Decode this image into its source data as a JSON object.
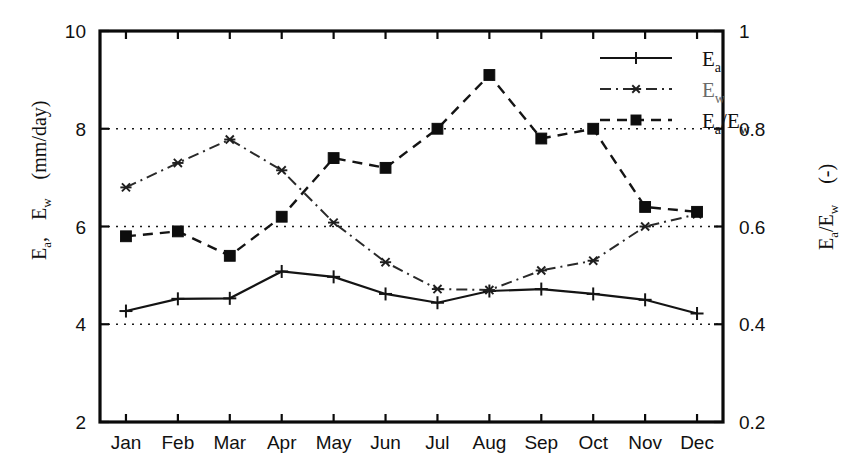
{
  "chart_data": {
    "type": "line",
    "title": "",
    "subtitle": "",
    "xlabel": "",
    "ylabel": "E_a ,  E_w   (mm/day)",
    "y2label": "E_a / E_w   (-)",
    "categories": [
      "Jan",
      "Feb",
      "Mar",
      "Apr",
      "May",
      "Jun",
      "Jul",
      "Aug",
      "Sep",
      "Oct",
      "Nov",
      "Dec"
    ],
    "ylim": [
      2,
      10
    ],
    "yticks": [
      2,
      4,
      6,
      8,
      10
    ],
    "ytick_labels": [
      "2",
      "4",
      "6",
      "8",
      "10"
    ],
    "y2lim": [
      0.2,
      1.0
    ],
    "y2ticks": [
      0.2,
      0.4,
      0.6,
      0.8,
      1.0
    ],
    "y2tick_labels": [
      "0.2",
      "0.4",
      "0.6",
      "0.8",
      "1"
    ],
    "grid": true,
    "gridlines_at": [
      4,
      6,
      8
    ],
    "legend_position": "top-right",
    "series": [
      {
        "name": "E_a",
        "legend_label_base": "E",
        "legend_label_sub": "a",
        "axis": "left",
        "line_style": "solid",
        "marker": "plus",
        "values": [
          4.27,
          4.52,
          4.53,
          5.08,
          4.97,
          4.62,
          4.44,
          4.68,
          4.72,
          4.62,
          4.5,
          4.22
        ]
      },
      {
        "name": "E_w",
        "legend_label_base": "E",
        "legend_label_sub": "w",
        "axis": "left",
        "line_style": "dashdot",
        "marker": "star",
        "values": [
          6.8,
          7.3,
          7.78,
          7.15,
          6.08,
          5.27,
          4.72,
          4.7,
          5.1,
          5.3,
          6.0,
          6.25
        ]
      },
      {
        "name": "E_a/E_w",
        "legend_label_base": "E",
        "legend_label_sub": "a",
        "legend_label_base2": "/E",
        "legend_label_sub2": "w",
        "axis": "right",
        "line_style": "dashed",
        "marker": "square",
        "values": [
          0.58,
          0.59,
          0.54,
          0.62,
          0.74,
          0.72,
          0.8,
          0.91,
          0.78,
          0.8,
          0.64,
          0.63
        ]
      }
    ]
  },
  "axes": {
    "left_title_part1": "E",
    "left_title_sub1": "a",
    "left_title_comma": ",",
    "left_title_part2": "E",
    "left_title_sub2": "w",
    "left_title_units": "(mm/day)",
    "right_title_part1": "E",
    "right_title_sub1": "a",
    "right_title_slash": "/E",
    "right_title_sub2": "w",
    "right_title_units": "(-)"
  },
  "colors": {
    "background": "#ffffff",
    "frame": "#0a0a0a",
    "series_ea": "#141414",
    "series_ew": "#2a2a2a",
    "series_ratio": "#0d0d0d",
    "grid": "#1a1a1a"
  }
}
